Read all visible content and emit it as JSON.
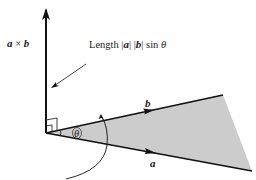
{
  "diagram": {
    "labels": {
      "cross_product_a": "a",
      "cross_product_times": " × ",
      "cross_product_b": "b",
      "length_prefix": "Length |",
      "length_a": "a",
      "length_mid": "| |",
      "length_b": "b",
      "length_suffix": "| sin ",
      "length_theta": "θ",
      "vector_b": "b",
      "vector_a": "a",
      "angle": "θ"
    },
    "colors": {
      "line": "#111111",
      "fill": "#cccccc",
      "background": "#ffffff"
    },
    "geometry": {
      "origin": [
        46,
        133
      ],
      "cross_tip": [
        46,
        8
      ],
      "b_end": [
        223,
        95
      ],
      "a_end": [
        252,
        171
      ]
    }
  }
}
